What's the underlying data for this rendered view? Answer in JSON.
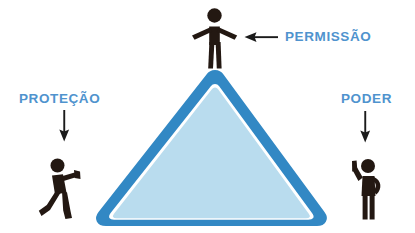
{
  "diagram": {
    "title_visible": false,
    "background_color": "#ffffff",
    "labels": [
      {
        "id": "permissao",
        "text": "PERMISSÃO",
        "position": "top-right",
        "arrow": "arrow-left-icon",
        "points_to": "top-figure"
      },
      {
        "id": "protecao",
        "text": "PROTEÇÃO",
        "position": "left",
        "arrow": "arrow-down-icon",
        "points_to": "left-figure"
      },
      {
        "id": "poder",
        "text": "PODER",
        "position": "right",
        "arrow": "arrow-down-icon",
        "points_to": "right-figure"
      }
    ],
    "figures": [
      {
        "id": "top-figure",
        "pose": "arms-outstretched",
        "location": "apex-of-triangle"
      },
      {
        "id": "left-figure",
        "pose": "walking-pushing",
        "location": "left-of-triangle"
      },
      {
        "id": "right-figure",
        "pose": "arm-raised-pointing-up",
        "location": "right-of-triangle"
      }
    ],
    "shape": {
      "type": "triangle",
      "fill_color": "#b9dcee",
      "border_color": "#3288c4",
      "inner_gap_color": "#ffffff",
      "corners": "rounded"
    },
    "colors": {
      "label_text": "#4f93ce",
      "arrow": "#1b1b1b",
      "figure": "#231812",
      "triangle_fill": "#b9dcee",
      "triangle_border": "#3288c4"
    }
  }
}
